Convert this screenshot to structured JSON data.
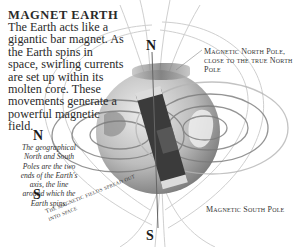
{
  "heading": "MAGNET EARTH",
  "intro_text": "The Earth acts like a gigantic bar magnet. As the Earth spins in space, swirling currents are set up within its molten core. These movements generate a powerful magnetic field.",
  "geographic_axis": {
    "north_label": "N",
    "south_label": "S",
    "note": "The geographical North and South Poles are the two ends of the Earth's axis, the line around which the Earth spins."
  },
  "globe": {
    "north_label": "N",
    "south_label": "S"
  },
  "captions": {
    "magnetic_north": "Magnetic North Pole, close to the true North Pole",
    "magnetic_south": "Magnetic South Pole",
    "field_spread": "The magnetic fields spread out into space"
  },
  "colors": {
    "background": "#ffffff",
    "globe_light": "#d9d9d9",
    "globe_dark": "#8a8a8a",
    "magnet": "#3d3d3d",
    "field_lines": "#9a9a9a"
  }
}
